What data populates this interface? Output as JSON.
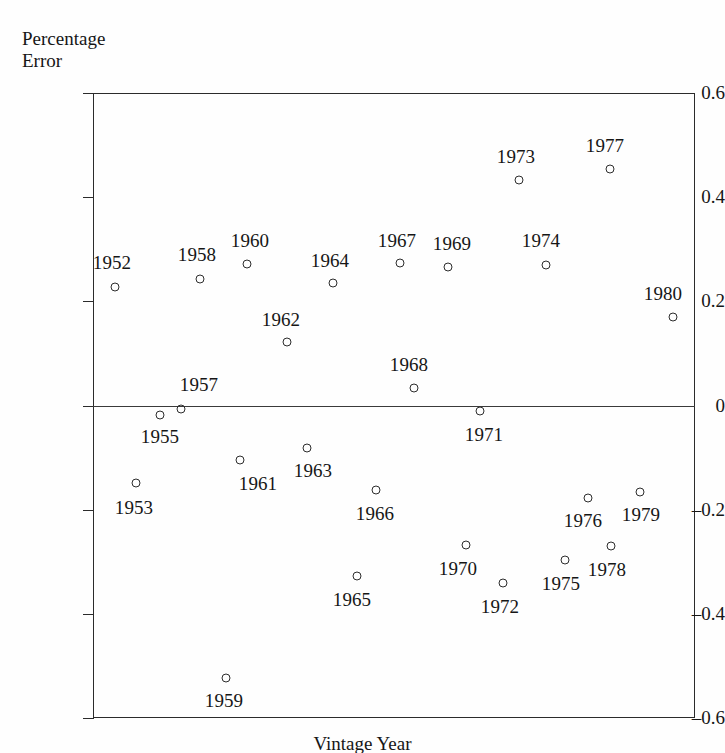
{
  "chart_data": {
    "type": "scatter",
    "title": "",
    "xlabel": "Vintage Year",
    "ylabel": "Percentage Error",
    "ylabel_lines": [
      "Percentage",
      "Error"
    ],
    "ylim": [
      -0.6,
      0.6
    ],
    "yticks": [
      0.6,
      0.4,
      0.2,
      0,
      -0.2,
      -0.4,
      -0.6
    ],
    "ytick_labels": [
      "0.6",
      "0.4",
      "0.2",
      "0",
      "–0.2",
      "–0.4",
      "–0.6"
    ],
    "xlim": [
      1951.2,
      1980.8
    ],
    "grid": false,
    "legend": null,
    "zero_line": true,
    "marker": "open-circle",
    "x": [
      1952,
      1953,
      1955,
      1957,
      1958,
      1959,
      1960,
      1961,
      1962,
      1963,
      1964,
      1965,
      1966,
      1967,
      1968,
      1969,
      1970,
      1971,
      1972,
      1973,
      1974,
      1975,
      1976,
      1977,
      1978,
      1979,
      1980
    ],
    "values": [
      0.227,
      -0.163,
      -0.021,
      -0.009,
      0.243,
      -0.531,
      0.27,
      -0.118,
      0.121,
      -0.089,
      0.234,
      -0.329,
      -0.176,
      0.272,
      0.032,
      0.266,
      -0.27,
      -0.013,
      -0.343,
      0.431,
      0.269,
      -0.295,
      -0.191,
      0.456,
      -0.271,
      -0.18,
      0.17
    ],
    "points": [
      {
        "year": "1952",
        "value": 0.227,
        "px": 115,
        "py": 287,
        "lx": 112,
        "ly": 263
      },
      {
        "year": "1953",
        "value": -0.163,
        "px": 136,
        "py": 483,
        "lx": 134,
        "ly": 508
      },
      {
        "year": "1955",
        "value": -0.021,
        "px": 160,
        "py": 415,
        "lx": 160,
        "ly": 437
      },
      {
        "year": "1957",
        "value": -0.009,
        "px": 181,
        "py": 409,
        "lx": 199,
        "ly": 385
      },
      {
        "year": "1958",
        "value": 0.243,
        "px": 200,
        "py": 279,
        "lx": 197,
        "ly": 255
      },
      {
        "year": "1959",
        "value": -0.531,
        "px": 226,
        "py": 678,
        "lx": 224,
        "ly": 701
      },
      {
        "year": "1960",
        "value": 0.27,
        "px": 247,
        "py": 264,
        "lx": 250,
        "ly": 241
      },
      {
        "year": "1961",
        "value": -0.118,
        "px": 240,
        "py": 460,
        "lx": 258,
        "ly": 484
      },
      {
        "year": "1962",
        "value": 0.121,
        "px": 287,
        "py": 342,
        "lx": 281,
        "ly": 320
      },
      {
        "year": "1963",
        "value": -0.089,
        "px": 307,
        "py": 448,
        "lx": 313,
        "ly": 471
      },
      {
        "year": "1964",
        "value": 0.234,
        "px": 333,
        "py": 283,
        "lx": 330,
        "ly": 261
      },
      {
        "year": "1965",
        "value": -0.329,
        "px": 357,
        "py": 576,
        "lx": 352,
        "ly": 600
      },
      {
        "year": "1966",
        "value": -0.176,
        "px": 376,
        "py": 490,
        "lx": 375,
        "ly": 514
      },
      {
        "year": "1967",
        "value": 0.272,
        "px": 400,
        "py": 263,
        "lx": 397,
        "ly": 241
      },
      {
        "year": "1968",
        "value": 0.032,
        "px": 414,
        "py": 388,
        "lx": 409,
        "ly": 365
      },
      {
        "year": "1969",
        "value": 0.266,
        "px": 448,
        "py": 267,
        "lx": 452,
        "ly": 244
      },
      {
        "year": "1970",
        "value": -0.27,
        "px": 466,
        "py": 545,
        "lx": 458,
        "ly": 569
      },
      {
        "year": "1971",
        "value": -0.013,
        "px": 480,
        "py": 411,
        "lx": 484,
        "ly": 435
      },
      {
        "year": "1972",
        "value": -0.343,
        "px": 503,
        "py": 583,
        "lx": 500,
        "ly": 607
      },
      {
        "year": "1973",
        "value": 0.431,
        "px": 519,
        "py": 180,
        "lx": 516,
        "ly": 157
      },
      {
        "year": "1974",
        "value": 0.269,
        "px": 546,
        "py": 265,
        "lx": 541,
        "ly": 241
      },
      {
        "year": "1975",
        "value": -0.295,
        "px": 565,
        "py": 560,
        "lx": 561,
        "ly": 584
      },
      {
        "year": "1976",
        "value": -0.191,
        "px": 588,
        "py": 498,
        "lx": 583,
        "ly": 521
      },
      {
        "year": "1977",
        "value": 0.456,
        "px": 610,
        "py": 169,
        "lx": 605,
        "ly": 146
      },
      {
        "year": "1978",
        "value": -0.271,
        "px": 611,
        "py": 546,
        "lx": 607,
        "ly": 570
      },
      {
        "year": "1979",
        "value": -0.18,
        "px": 640,
        "py": 492,
        "lx": 641,
        "ly": 515
      },
      {
        "year": "1980",
        "value": 0.17,
        "px": 673,
        "py": 317,
        "lx": 663,
        "ly": 294
      }
    ]
  },
  "axes": {
    "plot_left": 93,
    "plot_right": 695,
    "plot_top": 93,
    "plot_bottom": 718,
    "zero_y": 405.5
  },
  "colors": {
    "axis": "#2b2b2b",
    "marker": "#2d2d2d",
    "text": "#161616",
    "background": "#fefefe"
  }
}
